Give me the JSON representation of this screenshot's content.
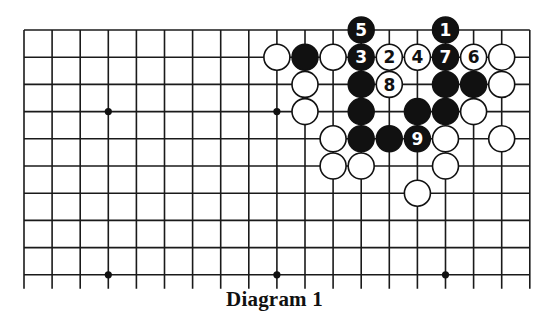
{
  "figure": {
    "caption": "Diagram 1",
    "board": {
      "size": 19,
      "visible_rows": 10,
      "visible_cols": 19,
      "origin_x": 24,
      "origin_y": 30,
      "spacing_x": 28.1,
      "spacing_y": 27.2,
      "tail_length": 14,
      "stone_radius": 13,
      "star_points": [
        [
          3,
          3
        ],
        [
          9,
          3
        ],
        [
          15,
          3
        ],
        [
          3,
          9
        ],
        [
          9,
          9
        ],
        [
          15,
          9
        ]
      ],
      "colors": {
        "line": "#1a1a1a",
        "black_stone": "#111111",
        "white_stone": "#ffffff"
      }
    },
    "stones": [
      {
        "col": 15,
        "row": 0,
        "color": "black",
        "label": "1"
      },
      {
        "col": 13,
        "row": 1,
        "color": "white",
        "label": "2"
      },
      {
        "col": 12,
        "row": 1,
        "color": "black",
        "label": "3"
      },
      {
        "col": 14,
        "row": 1,
        "color": "white",
        "label": "4"
      },
      {
        "col": 12,
        "row": 0,
        "color": "black",
        "label": "5"
      },
      {
        "col": 16,
        "row": 1,
        "color": "white",
        "label": "6"
      },
      {
        "col": 15,
        "row": 1,
        "color": "black",
        "label": "7"
      },
      {
        "col": 13,
        "row": 2,
        "color": "white",
        "label": "8"
      },
      {
        "col": 14,
        "row": 4,
        "color": "black",
        "label": "9"
      },
      {
        "col": 9,
        "row": 1,
        "color": "white",
        "label": ""
      },
      {
        "col": 10,
        "row": 1,
        "color": "black",
        "label": ""
      },
      {
        "col": 11,
        "row": 1,
        "color": "white",
        "label": ""
      },
      {
        "col": 17,
        "row": 1,
        "color": "white",
        "label": ""
      },
      {
        "col": 10,
        "row": 2,
        "color": "white",
        "label": ""
      },
      {
        "col": 12,
        "row": 2,
        "color": "black",
        "label": ""
      },
      {
        "col": 15,
        "row": 2,
        "color": "black",
        "label": ""
      },
      {
        "col": 16,
        "row": 2,
        "color": "black",
        "label": ""
      },
      {
        "col": 17,
        "row": 2,
        "color": "white",
        "label": ""
      },
      {
        "col": 10,
        "row": 3,
        "color": "white",
        "label": ""
      },
      {
        "col": 12,
        "row": 3,
        "color": "black",
        "label": ""
      },
      {
        "col": 14,
        "row": 3,
        "color": "black",
        "label": ""
      },
      {
        "col": 15,
        "row": 3,
        "color": "black",
        "label": ""
      },
      {
        "col": 16,
        "row": 3,
        "color": "white",
        "label": ""
      },
      {
        "col": 11,
        "row": 4,
        "color": "white",
        "label": ""
      },
      {
        "col": 12,
        "row": 4,
        "color": "black",
        "label": ""
      },
      {
        "col": 13,
        "row": 4,
        "color": "black",
        "label": ""
      },
      {
        "col": 15,
        "row": 4,
        "color": "white",
        "label": ""
      },
      {
        "col": 17,
        "row": 4,
        "color": "white",
        "label": ""
      },
      {
        "col": 11,
        "row": 5,
        "color": "white",
        "label": ""
      },
      {
        "col": 12,
        "row": 5,
        "color": "white",
        "label": ""
      },
      {
        "col": 15,
        "row": 5,
        "color": "white",
        "label": ""
      },
      {
        "col": 14,
        "row": 6,
        "color": "white",
        "label": ""
      }
    ]
  }
}
